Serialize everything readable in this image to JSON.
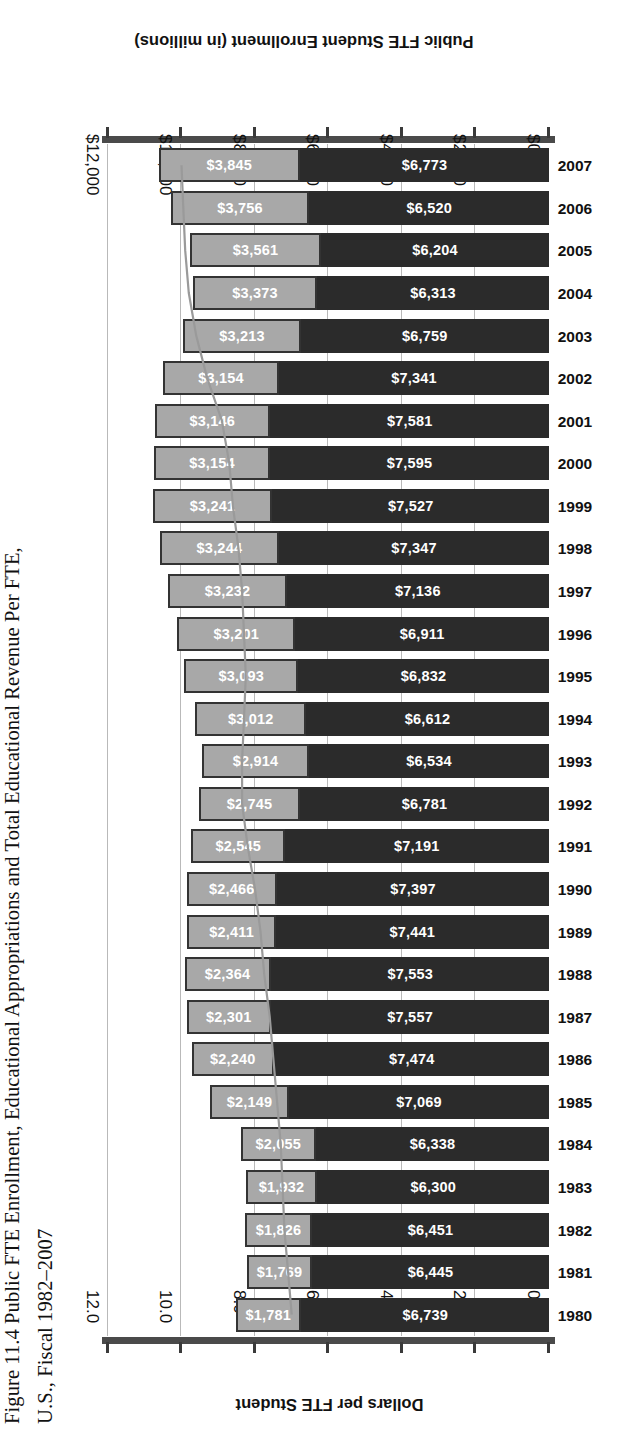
{
  "figure": {
    "title": "Figure 11.4  Public FTE Enrollment, Educational Appropriations and Total Educational Revenue Per FTE,\nU.S., Fiscal 1982–2007"
  },
  "chart_data": {
    "type": "bar",
    "orientation": "horizontal-stacked-with-line",
    "title": "Figure 11.4  Public FTE Enrollment, Educational Appropriations and Total Educational Revenue Per FTE, U.S., Fiscal 1982–2007",
    "xlabel": "Dollars per FTE Student",
    "ylabel": "Public FTE Student Enrollment (in millions)",
    "categories": [
      "1980",
      "1981",
      "1982",
      "1983",
      "1984",
      "1985",
      "1986",
      "1987",
      "1988",
      "1989",
      "1990",
      "1991",
      "1992",
      "1993",
      "1994",
      "1995",
      "1996",
      "1997",
      "1998",
      "1999",
      "2000",
      "2001",
      "2002",
      "2003",
      "2004",
      "2005",
      "2006",
      "2007"
    ],
    "series": [
      {
        "name": "Educational Appropriations",
        "color": "#2b2b2b",
        "values": [
          6739,
          6445,
          6451,
          6300,
          6338,
          7069,
          7474,
          7557,
          7553,
          7441,
          7397,
          7191,
          6781,
          6534,
          6612,
          6832,
          6911,
          7136,
          7347,
          7527,
          7595,
          7581,
          7341,
          6759,
          6313,
          6204,
          6520,
          6773
        ],
        "labels": [
          "$6,739",
          "$6,445",
          "$6,451",
          "$6,300",
          "$6,338",
          "$7,069",
          "$7,474",
          "$7,557",
          "$7,553",
          "$7,441",
          "$7,397",
          "$7,191",
          "$6,781",
          "$6,534",
          "$6,612",
          "$6,832",
          "$6,911",
          "$7,136",
          "$7,347",
          "$7,527",
          "$7,595",
          "$7,581",
          "$7,341",
          "$6,759",
          "$6,313",
          "$6,204",
          "$6,520",
          "$6,773"
        ]
      },
      {
        "name": "Net Tuition",
        "color": "#a8a8a8",
        "values": [
          1781,
          1769,
          1826,
          1932,
          2055,
          2149,
          2240,
          2301,
          2364,
          2411,
          2466,
          2545,
          2745,
          2914,
          3012,
          3093,
          3201,
          3232,
          3244,
          3241,
          3154,
          3146,
          3154,
          3213,
          3373,
          3561,
          3756,
          3845
        ],
        "labels": [
          "$1,781",
          "$1,769",
          "$1,826",
          "$1,932",
          "$2,055",
          "$2,149",
          "$2,240",
          "$2,301",
          "$2,364",
          "$2,411",
          "$2,466",
          "$2,545",
          "$2,745",
          "$2,914",
          "$3,012",
          "$3,093",
          "$3,201",
          "$3,232",
          "$3,244",
          "$3,241",
          "$3,154",
          "$3,146",
          "$3,154",
          "$3,213",
          "$3,373",
          "$3,561",
          "$3,756",
          "$3,845"
        ]
      },
      {
        "name": "Public FTE Student Enrollment (in millions)",
        "type": "line",
        "color": "#9a9a9a",
        "values": [
          7.0,
          7.1,
          7.2,
          7.25,
          7.3,
          7.4,
          7.5,
          7.6,
          7.75,
          7.85,
          8.0,
          8.2,
          8.35,
          8.35,
          8.3,
          8.25,
          8.3,
          8.35,
          8.45,
          8.6,
          8.7,
          8.9,
          9.3,
          9.6,
          9.8,
          9.9,
          9.95,
          10.0
        ]
      }
    ],
    "axes": {
      "dollars": {
        "label": "Dollars per FTE Student",
        "ticks": [
          0,
          2000,
          4000,
          6000,
          8000,
          10000,
          12000
        ],
        "tick_labels": [
          "$0",
          "$2,000",
          "$4,000",
          "$6,000",
          "$8,000",
          "$10,000",
          "$12,000"
        ],
        "range": [
          0,
          12000
        ],
        "position": "top"
      },
      "enrollment": {
        "label": "Public FTE Student Enrollment (in millions)",
        "ticks": [
          0.0,
          2.0,
          4.0,
          6.0,
          8.0,
          10.0,
          12.0
        ],
        "tick_labels": [
          "0.0",
          "2.0",
          "4.0",
          "6.0",
          "8.0",
          "10.0",
          "12.0"
        ],
        "range": [
          0,
          12
        ],
        "position": "bottom"
      }
    },
    "grid": true,
    "legend": null
  }
}
